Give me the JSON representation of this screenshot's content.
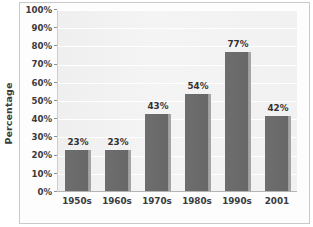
{
  "chart_data": {
    "type": "bar",
    "title": "",
    "subtitle": "",
    "xlabel": "",
    "ylabel": "Percentage",
    "categories": [
      "1950s",
      "1960s",
      "1970s",
      "1980s",
      "1990s",
      "2001"
    ],
    "values": [
      23,
      23,
      43,
      54,
      77,
      42
    ],
    "data_labels": [
      "23%",
      "23%",
      "43%",
      "54%",
      "77%",
      "42%"
    ],
    "ylim": [
      0,
      100
    ],
    "ytick_values": [
      100,
      90,
      80,
      70,
      60,
      50,
      40,
      30,
      20,
      10,
      0
    ],
    "ytick_labels": [
      "100%",
      "90%",
      "80%",
      "70%",
      "60%",
      "50%",
      "40%",
      "30%",
      "20%",
      "10%",
      "0%"
    ],
    "grid": true,
    "grid_orientation": "horizontal",
    "legend": null,
    "legend_position": "none",
    "annotations": [],
    "colors": {
      "bar_fill": "#6b6b6b",
      "bar_edge_highlight": "#a8a8a8",
      "plot_background": "#f1f1f1",
      "gridline": "#ffffff",
      "axis": "#b4b4b4",
      "text": "#3b3b3b",
      "frame_border": "#c9c9c9",
      "page_background": "#ffffff"
    }
  }
}
